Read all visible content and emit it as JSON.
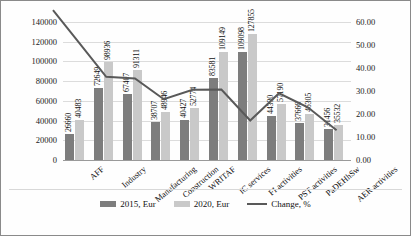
{
  "chart_data": {
    "type": "bar",
    "title": "",
    "xlabel": "",
    "ylabel": "",
    "grid": true,
    "legend_position": "bottom",
    "categories": [
      "AFF",
      "Industry",
      "Manufacturing",
      "Construction",
      "WRITAF",
      "IC services",
      "FI activities",
      "PST activities",
      "PaDEHhSw",
      "AER activities"
    ],
    "y_axis_left": {
      "ticks": [
        "0",
        "20000",
        "40000",
        "60000",
        "80000",
        "100000",
        "120000",
        "140000"
      ],
      "min": 0,
      "max": 140000,
      "step": 20000
    },
    "y_axis_right": {
      "ticks": [
        "0.00",
        "10.00",
        "20.00",
        "30.00",
        "40.00",
        "50.00",
        "60.00"
      ],
      "min": 0,
      "max": 60,
      "step": 10
    },
    "series": [
      {
        "name": "2015, Eur",
        "type": "bar",
        "color": "#7d7d7d",
        "axis": "left",
        "values": [
          26660,
          72649,
          67407,
          38707,
          40427,
          83581,
          109098,
          44330,
          37666,
          31456
        ]
      },
      {
        "name": "2020, Eur",
        "type": "bar",
        "color": "#c9c9c9",
        "axis": "left",
        "values": [
          40483,
          98936,
          91311,
          48946,
          52774,
          109149,
          127855,
          57190,
          46305,
          35532
        ]
      },
      {
        "name": "Change, %",
        "type": "line",
        "color": "#595959",
        "axis": "right",
        "values": [
          51.85,
          36.18,
          35.46,
          26.45,
          30.54,
          30.59,
          17.19,
          29.01,
          22.93,
          12.96
        ]
      }
    ]
  },
  "legend": {
    "items": [
      {
        "label": "2015, Eur",
        "marker": "swatch-dark"
      },
      {
        "label": "2020, Eur",
        "marker": "swatch-light"
      },
      {
        "label": "Change, %",
        "marker": "line-gray"
      }
    ]
  }
}
